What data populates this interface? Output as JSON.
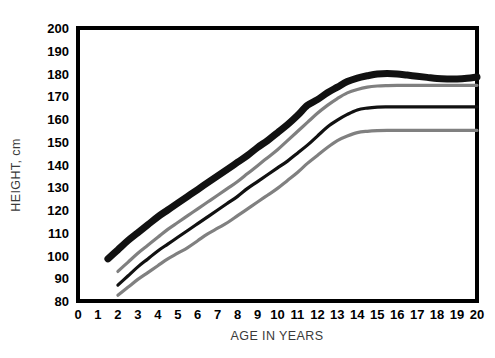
{
  "chart_data": {
    "type": "line",
    "title": "",
    "xlabel": "AGE IN YEARS",
    "ylabel": "HEIGHT, cm",
    "xlim": [
      0,
      20
    ],
    "ylim": [
      80,
      200
    ],
    "grid": false,
    "legend": "none",
    "x_ticks": [
      "0",
      "1",
      "2",
      "3",
      "4",
      "5",
      "6",
      "7",
      "8",
      "9",
      "10",
      "11",
      "12",
      "13",
      "14",
      "15",
      "16",
      "17",
      "18",
      "19",
      "20"
    ],
    "y_ticks": [
      "80",
      "90",
      "100",
      "110",
      "120",
      "130",
      "140",
      "150",
      "160",
      "170",
      "180",
      "190",
      "200"
    ],
    "series": [
      {
        "name": "boys-upper-percentile",
        "color": "#111111",
        "width": 7,
        "x": [
          1.5,
          2,
          2.5,
          3,
          3.5,
          4,
          4.5,
          5,
          5.5,
          6,
          6.5,
          7,
          7.5,
          8,
          8.5,
          9,
          9.5,
          10,
          10.5,
          11,
          11.5,
          12,
          12.5,
          13,
          13.5,
          14,
          14.5,
          15,
          15.5,
          16,
          16.5,
          17,
          17.5,
          18,
          18.5,
          19,
          19.5,
          20
        ],
        "y": [
          98.5,
          102.5,
          106.5,
          110.0,
          113.5,
          117.0,
          120.0,
          123.0,
          126.0,
          129.0,
          132.0,
          135.0,
          138.0,
          141.0,
          144.0,
          147.5,
          150.5,
          154.0,
          157.5,
          161.5,
          166.0,
          168.5,
          171.5,
          174.0,
          176.5,
          178.0,
          179.0,
          179.8,
          180.0,
          179.8,
          179.3,
          178.8,
          178.3,
          177.8,
          177.6,
          177.6,
          177.9,
          178.5
        ]
      },
      {
        "name": "girls-upper-percentile",
        "color": "#808080",
        "width": 3.2,
        "x": [
          2,
          2.5,
          3,
          3.5,
          4,
          4.5,
          5,
          5.5,
          6,
          6.5,
          7,
          7.5,
          8,
          8.5,
          9,
          9.5,
          10,
          10.5,
          11,
          11.5,
          12,
          12.5,
          13,
          13.5,
          14,
          14.5,
          15,
          15.5,
          16,
          17,
          18,
          19,
          20
        ],
        "y": [
          93.0,
          97.0,
          101.0,
          104.5,
          108.0,
          111.5,
          114.5,
          117.5,
          120.5,
          123.5,
          126.5,
          129.5,
          132.5,
          136.0,
          139.5,
          143.0,
          146.5,
          150.5,
          154.5,
          158.5,
          162.5,
          166.0,
          169.0,
          171.5,
          173.0,
          174.0,
          174.5,
          174.7,
          174.8,
          174.8,
          174.8,
          174.8,
          174.8
        ]
      },
      {
        "name": "boys-lower-percentile",
        "color": "#111111",
        "width": 3.2,
        "x": [
          2,
          2.5,
          3,
          3.5,
          4,
          4.5,
          5,
          5.5,
          6,
          6.5,
          7,
          7.5,
          8,
          8.5,
          9,
          9.5,
          10,
          10.5,
          11,
          11.5,
          12,
          12.5,
          13,
          13.5,
          14,
          14.5,
          15,
          15.5,
          16,
          17,
          18,
          19,
          20
        ],
        "y": [
          87.0,
          91.0,
          95.0,
          98.5,
          102.0,
          105.0,
          108.0,
          111.0,
          114.0,
          117.0,
          120.0,
          123.0,
          126.0,
          129.5,
          132.5,
          135.5,
          138.5,
          141.5,
          145.0,
          148.5,
          152.5,
          156.5,
          159.5,
          162.0,
          164.0,
          164.8,
          165.2,
          165.3,
          165.3,
          165.3,
          165.3,
          165.3,
          165.3
        ]
      },
      {
        "name": "girls-lower-percentile",
        "color": "#808080",
        "width": 3.2,
        "x": [
          2,
          2.5,
          3,
          3.5,
          4,
          4.5,
          5,
          5.5,
          6,
          6.5,
          7,
          7.5,
          8,
          8.5,
          9,
          9.5,
          10,
          10.5,
          11,
          11.5,
          12,
          12.5,
          13,
          13.5,
          14,
          14.5,
          15,
          15.5,
          16,
          17,
          18,
          19,
          20
        ],
        "y": [
          82.5,
          86.0,
          89.5,
          92.5,
          95.5,
          98.5,
          101.0,
          103.5,
          106.5,
          109.5,
          112.0,
          114.5,
          117.5,
          120.5,
          123.5,
          126.5,
          129.5,
          133.0,
          136.5,
          140.5,
          144.0,
          147.5,
          150.5,
          152.5,
          154.0,
          154.6,
          154.9,
          155.0,
          155.0,
          155.0,
          155.0,
          155.0,
          155.0
        ]
      }
    ]
  },
  "axes": {
    "frame_color": "#000000",
    "background": "#ffffff"
  }
}
